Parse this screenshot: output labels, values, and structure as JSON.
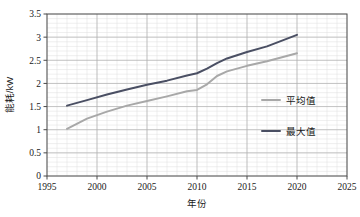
{
  "chart_data": {
    "type": "line",
    "title": "",
    "xlabel": "年份",
    "ylabel": "能耗/kW",
    "xlim": [
      1995,
      2025
    ],
    "ylim": [
      0,
      3.5
    ],
    "xticks": [
      1995,
      2000,
      2005,
      2010,
      2015,
      2020,
      2025
    ],
    "xtick_labels": [
      "1995",
      "2000",
      "2005",
      "2010",
      "2015",
      "2020",
      "2025"
    ],
    "yticks": [
      0,
      0.5,
      1,
      1.5,
      2,
      2.5,
      3,
      3.5
    ],
    "ytick_labels": [
      "0",
      "0.5",
      "1",
      "1.5",
      "2",
      "2.5",
      "3",
      "3.5"
    ],
    "grid": true,
    "minor_grid": true,
    "minor_divisions": 5,
    "legend_position": "inside-right",
    "legend_frame": false,
    "series": [
      {
        "name": "平均值",
        "color": "#a8a8a8",
        "x": [
          1997,
          1999,
          2001,
          2003,
          2005,
          2007,
          2009,
          2010,
          2011,
          2012,
          2013,
          2015,
          2017,
          2020
        ],
        "values": [
          1.02,
          1.24,
          1.39,
          1.52,
          1.62,
          1.72,
          1.83,
          1.86,
          1.98,
          2.16,
          2.26,
          2.38,
          2.48,
          2.65
        ]
      },
      {
        "name": "最大值",
        "color": "#4a4f63",
        "x": [
          1997,
          1999,
          2001,
          2003,
          2005,
          2007,
          2009,
          2010,
          2011,
          2012,
          2013,
          2015,
          2017,
          2020
        ],
        "values": [
          1.52,
          1.64,
          1.76,
          1.87,
          1.97,
          2.06,
          2.17,
          2.22,
          2.32,
          2.44,
          2.54,
          2.68,
          2.8,
          3.05
        ]
      }
    ]
  },
  "legend": {
    "items": [
      {
        "label": "平均值",
        "color": "#a8a8a8"
      },
      {
        "label": "最大值",
        "color": "#4a4f63"
      }
    ]
  },
  "axes": {
    "x_title": "年份",
    "y_title": "能耗/kW"
  }
}
